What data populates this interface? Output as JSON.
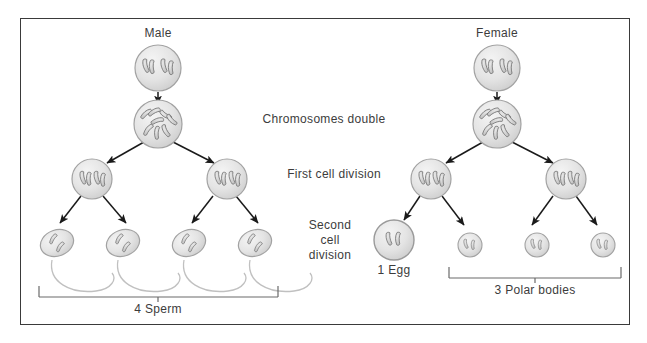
{
  "figure": {
    "background_color": "#ffffff",
    "frame_border_color": "#3a3a3a"
  },
  "labels": {
    "male": "Male",
    "female": "Female",
    "chromosomes_double": "Chromosomes double",
    "first_cell_division": "First cell division",
    "second_cell_division_line1": "Second",
    "second_cell_division_line2": "cell",
    "second_cell_division_line3": "division",
    "four_sperm": "4 Sperm",
    "one_egg": "1 Egg",
    "three_polar_bodies": "3 Polar bodies"
  },
  "diagram_data": {
    "type": "flow-diagram",
    "colors": {
      "cell_fill": "#e2e2e2",
      "cell_stroke": "#9a9a9a",
      "chromosome_fill": "#cfcfcf",
      "chromosome_stroke": "#6e6e6e",
      "arrow_color": "#1a1a1a",
      "bracket_color": "#5a5a5a",
      "tail_color": "#b4b4b4",
      "text_color": "#3c3c3c"
    },
    "branches": [
      {
        "name": "male",
        "label": "Male",
        "stages": [
          {
            "stage": "germ-cell",
            "cells": 1,
            "chromosomes_per_cell": 4
          },
          {
            "stage": "chromosomes-double",
            "cells": 1,
            "chromosomes_per_cell": 8
          },
          {
            "stage": "first-cell-division",
            "cells": 2,
            "chromosomes_per_cell": 4
          },
          {
            "stage": "second-cell-division",
            "cells": 4,
            "chromosomes_per_cell": 2
          }
        ],
        "outcome": {
          "label": "4 Sperm",
          "count": 4,
          "cell_type": "sperm"
        }
      },
      {
        "name": "female",
        "label": "Female",
        "stages": [
          {
            "stage": "germ-cell",
            "cells": 1,
            "chromosomes_per_cell": 4
          },
          {
            "stage": "chromosomes-double",
            "cells": 1,
            "chromosomes_per_cell": 8
          },
          {
            "stage": "first-cell-division",
            "cells": 2,
            "chromosomes_per_cell": 4
          },
          {
            "stage": "second-cell-division",
            "cells": 4,
            "chromosomes_per_cell": 2
          }
        ],
        "outcomes": [
          {
            "label": "1 Egg",
            "count": 1,
            "cell_type": "egg"
          },
          {
            "label": "3 Polar bodies",
            "count": 3,
            "cell_type": "polar-body"
          }
        ]
      }
    ]
  }
}
